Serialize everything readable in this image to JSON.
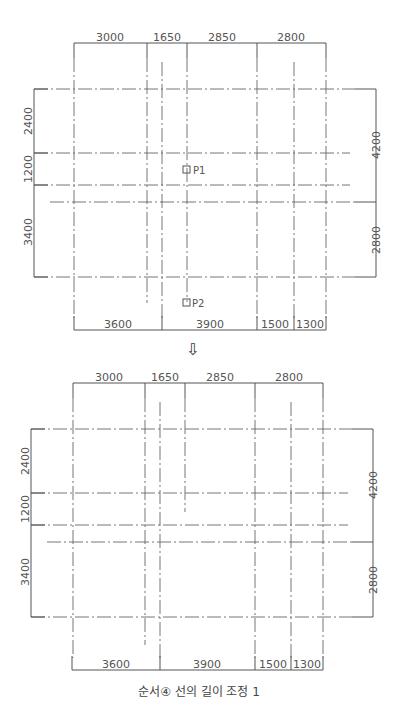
{
  "header_strip": {
    "text": ""
  },
  "arrow_icon": "⇩",
  "caption": "순서④ 선의 길이 조정 1",
  "colors": {
    "line": "#555555",
    "grid_line": "#666666",
    "text": "#555555"
  },
  "diagrams": [
    {
      "name": "before",
      "top_dims": [
        "3000",
        "1650",
        "2850",
        "2800"
      ],
      "bottom_dims": [
        "3600",
        "3900",
        "1500",
        "1300"
      ],
      "left_dims": [
        "2400",
        "1200",
        "3400"
      ],
      "right_dims": [
        "4200",
        "2800"
      ],
      "points": [
        {
          "label": "P1"
        },
        {
          "label": "P2"
        }
      ]
    },
    {
      "name": "after",
      "top_dims": [
        "3000",
        "1650",
        "2850",
        "2800"
      ],
      "bottom_dims": [
        "3600",
        "3900",
        "1500",
        "1300"
      ],
      "left_dims": [
        "2400",
        "1200",
        "3400"
      ],
      "right_dims": [
        "4200",
        "2800"
      ]
    }
  ]
}
